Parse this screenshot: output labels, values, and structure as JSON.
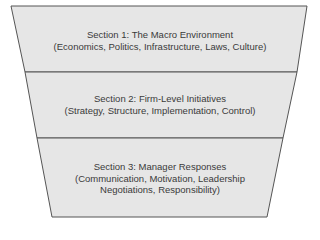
{
  "diagram": {
    "type": "funnel",
    "fill_color": "#e6e6e6",
    "stroke_color": "#555555",
    "sections": [
      {
        "title": "Section 1: The Macro Environment",
        "lines": [
          "(Economics, Politics, Infrastructure, Laws, Culture)"
        ]
      },
      {
        "title": "Section 2: Firm-Level Initiatives",
        "lines": [
          "(Strategy, Structure, Implementation, Control)"
        ]
      },
      {
        "title": "Section 3: Manager Responses",
        "lines": [
          "(Communication, Motivation, Leadership",
          "Negotiations, Responsibility)"
        ]
      }
    ]
  }
}
